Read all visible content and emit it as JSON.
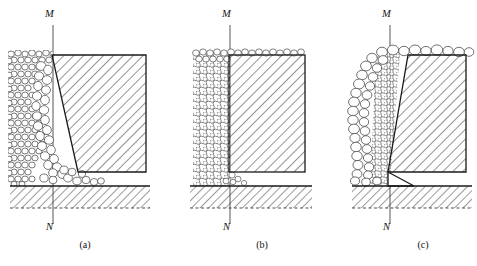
{
  "figure": {
    "type": "engineering-diagram",
    "panel_count": 3
  },
  "panels": [
    {
      "id": "a",
      "caption": "(a)",
      "top_label": "M",
      "bottom_label": "N",
      "wall_shape": "trapezoid-tilting-away",
      "soil_side": "left",
      "state": "active",
      "wall": {
        "top_left_x": 52,
        "top_right_x": 146,
        "top_y": 55,
        "bottom_left_x": 78,
        "bottom_right_x": 146,
        "bottom_y": 172
      },
      "axis": {
        "x": 53,
        "top_y": 25,
        "bottom_y": 224
      },
      "ground": {
        "left_x": 10,
        "right_x": 150,
        "y": 186,
        "depth": 22
      },
      "fill": {
        "left_x": 8,
        "right_x": 80,
        "top_y": 50,
        "bottom_y": 186
      }
    },
    {
      "id": "b",
      "caption": "(b)",
      "top_label": "M",
      "bottom_label": "N",
      "wall_shape": "rectangle-vertical",
      "soil_side": "left",
      "state": "at-rest",
      "wall": {
        "top_left_x": 229,
        "top_right_x": 305,
        "top_y": 55,
        "bottom_left_x": 229,
        "bottom_right_x": 305,
        "bottom_y": 172
      },
      "axis": {
        "x": 230,
        "top_y": 25,
        "bottom_y": 224
      },
      "ground": {
        "left_x": 190,
        "right_x": 312,
        "y": 186,
        "depth": 22
      },
      "fill": {
        "left_x": 193,
        "right_x": 230,
        "top_y": 50,
        "bottom_y": 186
      }
    },
    {
      "id": "c",
      "caption": "(c)",
      "top_label": "M",
      "bottom_label": "N",
      "wall_shape": "trapezoid-tilting-into-soil",
      "soil_side": "left",
      "state": "passive",
      "wall": {
        "top_left_x": 408,
        "top_right_x": 466,
        "top_y": 55,
        "bottom_left_x": 388,
        "bottom_right_x": 466,
        "bottom_y": 172
      },
      "axis": {
        "x": 390,
        "top_y": 25,
        "bottom_y": 224
      },
      "ground": {
        "left_x": 352,
        "right_x": 472,
        "y": 186,
        "depth": 22
      },
      "fill": {
        "left_x": 352,
        "right_x": 400,
        "top_y": 48,
        "bottom_y": 186
      }
    }
  ],
  "style": {
    "line_color": "#1a1a1a",
    "hatch_color": "#3a3a3a",
    "grain_stroke": "#555555",
    "grain_fill": "#ffffff",
    "axis_color": "#555555",
    "background": "#ffffff"
  }
}
